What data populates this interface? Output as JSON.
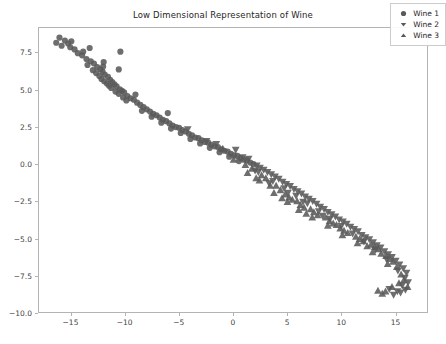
{
  "chart_data": {
    "type": "scatter",
    "title": "Low Dimensional Representation of Wine",
    "xlabel": "",
    "ylabel": "",
    "xlim": [
      -18.0,
      18.0
    ],
    "ylim": [
      -10.0,
      9.2
    ],
    "xticks": [
      -15,
      -10,
      -5,
      0,
      5,
      10,
      15
    ],
    "xticklabels": [
      "−15",
      "−10",
      "−5",
      "0",
      "5",
      "10",
      "15"
    ],
    "yticks": [
      7.5,
      5.0,
      2.5,
      0.0,
      -2.5,
      -5.0,
      -7.5,
      -10.0
    ],
    "yticklabels": [
      "7.5",
      "5.0",
      "2.5",
      "0.0",
      "−2.5",
      "−5.0",
      "−7.5",
      "−10.0"
    ],
    "grid": false,
    "legend_position": "upper right",
    "marker_color": "#5a5a5a",
    "marker_size": 3.1,
    "series": [
      {
        "name": "Wine 1",
        "marker": "circle",
        "color": "#5a5a5a",
        "points": [
          [
            -16.1,
            8.55
          ],
          [
            -15.6,
            8.35
          ],
          [
            -15.3,
            8.15
          ],
          [
            -15.9,
            8.0
          ],
          [
            -15.1,
            7.9
          ],
          [
            -14.7,
            7.75
          ],
          [
            -16.4,
            8.2
          ],
          [
            -15.0,
            8.3
          ],
          [
            -14.4,
            7.5
          ],
          [
            -14.0,
            7.35
          ],
          [
            -13.6,
            7.1
          ],
          [
            -13.9,
            7.6
          ],
          [
            -13.2,
            6.95
          ],
          [
            -13.5,
            6.7
          ],
          [
            -12.9,
            6.8
          ],
          [
            -12.6,
            6.55
          ],
          [
            -13.0,
            6.35
          ],
          [
            -12.3,
            6.4
          ],
          [
            -12.7,
            6.15
          ],
          [
            -12.1,
            6.25
          ],
          [
            -12.4,
            5.95
          ],
          [
            -11.9,
            6.05
          ],
          [
            -12.2,
            5.75
          ],
          [
            -11.6,
            5.9
          ],
          [
            -11.95,
            5.6
          ],
          [
            -11.4,
            5.7
          ],
          [
            -11.7,
            5.45
          ],
          [
            -12.05,
            6.6
          ],
          [
            -11.2,
            5.55
          ],
          [
            -11.5,
            5.3
          ],
          [
            -11.0,
            5.4
          ],
          [
            -11.3,
            5.15
          ],
          [
            -10.8,
            5.25
          ],
          [
            -10.5,
            5.05
          ],
          [
            -10.9,
            4.9
          ],
          [
            -10.3,
            4.95
          ],
          [
            -10.6,
            4.75
          ],
          [
            -10.1,
            4.85
          ],
          [
            -9.8,
            4.6
          ],
          [
            -10.2,
            4.5
          ],
          [
            -9.5,
            4.45
          ],
          [
            -9.9,
            4.3
          ],
          [
            -9.2,
            4.35
          ],
          [
            -8.9,
            4.15
          ],
          [
            -10.45,
            7.6
          ],
          [
            -10.6,
            6.4
          ],
          [
            -8.6,
            4.0
          ],
          [
            -8.3,
            3.85
          ],
          [
            -8.0,
            3.7
          ],
          [
            -8.45,
            3.6
          ],
          [
            -7.7,
            3.55
          ],
          [
            -7.4,
            3.4
          ],
          [
            -7.1,
            3.3
          ],
          [
            -7.55,
            3.2
          ],
          [
            -6.8,
            3.15
          ],
          [
            -6.5,
            3.0
          ],
          [
            -6.2,
            2.9
          ],
          [
            -6.65,
            2.8
          ],
          [
            -5.9,
            2.75
          ],
          [
            -5.6,
            2.6
          ],
          [
            -5.3,
            2.5
          ],
          [
            -5.75,
            2.4
          ],
          [
            -5.0,
            2.45
          ],
          [
            -4.7,
            2.3
          ],
          [
            -4.4,
            2.2
          ],
          [
            -4.85,
            2.1
          ],
          [
            -4.1,
            2.05
          ],
          [
            -3.8,
            1.95
          ],
          [
            -3.5,
            1.8
          ],
          [
            -3.95,
            1.7
          ],
          [
            -3.2,
            1.75
          ],
          [
            -2.9,
            1.6
          ],
          [
            -2.6,
            1.5
          ],
          [
            -3.05,
            1.4
          ],
          [
            -2.3,
            1.45
          ],
          [
            -2.0,
            1.3
          ],
          [
            -1.7,
            1.2
          ],
          [
            -2.15,
            1.1
          ],
          [
            -1.4,
            1.15
          ],
          [
            -1.1,
            1.0
          ],
          [
            -0.8,
            0.9
          ],
          [
            -1.25,
            0.8
          ],
          [
            -0.5,
            0.85
          ],
          [
            -0.2,
            0.7
          ],
          [
            0.1,
            0.6
          ],
          [
            -0.35,
            0.5
          ],
          [
            0.4,
            0.55
          ],
          [
            0.7,
            0.4
          ],
          [
            1.0,
            0.3
          ],
          [
            0.55,
            0.2
          ],
          [
            1.3,
            0.25
          ],
          [
            1.6,
            0.1
          ],
          [
            1.9,
            0.0
          ],
          [
            -13.3,
            7.85
          ],
          [
            -12.0,
            6.9
          ],
          [
            -9.05,
            4.7
          ],
          [
            -6.05,
            3.45
          ]
        ]
      },
      {
        "name": "Wine 2",
        "marker": "triangle-down",
        "color": "#5a5a5a",
        "points": [
          [
            -4.2,
            2.35
          ],
          [
            -2.45,
            1.55
          ],
          [
            -1.55,
            1.35
          ],
          [
            0.25,
            0.95
          ],
          [
            0.9,
            0.45
          ],
          [
            1.45,
            0.35
          ],
          [
            2.2,
            -0.1
          ],
          [
            2.5,
            -0.25
          ],
          [
            2.85,
            -0.4
          ],
          [
            3.2,
            -0.55
          ],
          [
            2.35,
            -0.55
          ],
          [
            3.55,
            -0.7
          ],
          [
            3.9,
            -0.85
          ],
          [
            4.25,
            -1.0
          ],
          [
            3.7,
            -1.15
          ],
          [
            4.6,
            -1.2
          ],
          [
            4.95,
            -1.35
          ],
          [
            5.3,
            -1.5
          ],
          [
            4.75,
            -1.65
          ],
          [
            5.65,
            -1.7
          ],
          [
            6.0,
            -1.85
          ],
          [
            6.35,
            -2.0
          ],
          [
            5.85,
            -2.15
          ],
          [
            6.7,
            -2.2
          ],
          [
            7.05,
            -2.35
          ],
          [
            7.4,
            -2.5
          ],
          [
            6.9,
            -2.65
          ],
          [
            7.75,
            -2.7
          ],
          [
            8.1,
            -2.9
          ],
          [
            8.45,
            -3.05
          ],
          [
            7.95,
            -3.2
          ],
          [
            8.8,
            -3.25
          ],
          [
            9.15,
            -3.4
          ],
          [
            9.5,
            -3.55
          ],
          [
            9.0,
            -3.7
          ],
          [
            9.85,
            -3.75
          ],
          [
            10.2,
            -3.9
          ],
          [
            10.55,
            -4.05
          ],
          [
            10.05,
            -4.2
          ],
          [
            10.9,
            -4.25
          ],
          [
            11.25,
            -4.4
          ],
          [
            11.6,
            -4.55
          ],
          [
            11.1,
            -4.7
          ],
          [
            11.95,
            -4.8
          ],
          [
            12.3,
            -4.95
          ],
          [
            12.65,
            -5.1
          ],
          [
            12.15,
            -5.25
          ],
          [
            13.0,
            -5.3
          ],
          [
            13.35,
            -5.5
          ],
          [
            13.7,
            -5.65
          ],
          [
            13.2,
            -5.8
          ],
          [
            14.05,
            -5.9
          ],
          [
            14.4,
            -6.1
          ],
          [
            14.75,
            -6.3
          ],
          [
            14.25,
            -6.45
          ],
          [
            15.1,
            -6.55
          ],
          [
            15.45,
            -6.8
          ],
          [
            15.8,
            -7.05
          ],
          [
            15.3,
            -7.2
          ],
          [
            16.1,
            -7.35
          ],
          [
            15.95,
            -7.7
          ],
          [
            16.25,
            -8.0
          ],
          [
            15.7,
            -8.2
          ],
          [
            16.0,
            -8.5
          ],
          [
            15.55,
            -8.7
          ],
          [
            14.9,
            -8.85
          ],
          [
            15.25,
            -8.6
          ],
          [
            14.5,
            -8.45
          ],
          [
            2.05,
            -0.45
          ],
          [
            3.35,
            -1.3
          ],
          [
            5.1,
            -1.95
          ],
          [
            6.5,
            -2.55
          ],
          [
            8.3,
            -3.5
          ]
        ]
      },
      {
        "name": "Wine 3",
        "marker": "triangle-up",
        "color": "#5a5a5a",
        "points": [
          [
            -0.95,
            1.05
          ],
          [
            0.05,
            0.3
          ],
          [
            1.15,
            -0.05
          ],
          [
            1.75,
            -0.3
          ],
          [
            2.65,
            -0.75
          ],
          [
            3.05,
            -0.95
          ],
          [
            2.15,
            -0.95
          ],
          [
            3.45,
            -1.45
          ],
          [
            4.0,
            -1.45
          ],
          [
            4.4,
            -1.75
          ],
          [
            3.8,
            -1.95
          ],
          [
            4.85,
            -2.05
          ],
          [
            5.2,
            -2.25
          ],
          [
            5.5,
            -2.4
          ],
          [
            5.05,
            -2.55
          ],
          [
            5.95,
            -2.5
          ],
          [
            6.25,
            -2.75
          ],
          [
            6.6,
            -2.95
          ],
          [
            6.1,
            -3.1
          ],
          [
            7.2,
            -3.05
          ],
          [
            7.5,
            -3.25
          ],
          [
            7.85,
            -3.45
          ],
          [
            7.35,
            -3.6
          ],
          [
            8.6,
            -3.6
          ],
          [
            8.95,
            -3.85
          ],
          [
            9.3,
            -4.0
          ],
          [
            8.8,
            -4.15
          ],
          [
            9.95,
            -4.35
          ],
          [
            10.3,
            -4.5
          ],
          [
            10.65,
            -4.65
          ],
          [
            10.15,
            -4.8
          ],
          [
            11.4,
            -4.9
          ],
          [
            11.75,
            -5.05
          ],
          [
            12.1,
            -5.2
          ],
          [
            11.55,
            -5.35
          ],
          [
            12.8,
            -5.45
          ],
          [
            13.15,
            -5.6
          ],
          [
            13.5,
            -5.75
          ],
          [
            12.95,
            -5.95
          ],
          [
            14.2,
            -6.2
          ],
          [
            14.55,
            -6.4
          ],
          [
            14.85,
            -6.6
          ],
          [
            14.35,
            -6.75
          ],
          [
            15.2,
            -6.95
          ],
          [
            15.6,
            -7.45
          ],
          [
            15.85,
            -7.85
          ],
          [
            15.4,
            -8.05
          ],
          [
            16.2,
            -8.3
          ],
          [
            14.75,
            -8.3
          ],
          [
            14.15,
            -8.6
          ],
          [
            13.85,
            -8.75
          ],
          [
            13.45,
            -8.55
          ],
          [
            1.35,
            -0.6
          ],
          [
            2.45,
            -1.1
          ],
          [
            4.55,
            -2.3
          ],
          [
            6.8,
            -3.35
          ],
          [
            9.6,
            -4.1
          ],
          [
            12.45,
            -5.55
          ],
          [
            13.75,
            -6.05
          ]
        ]
      }
    ]
  },
  "legend": {
    "entries": [
      {
        "label": "Wine 1",
        "marker": "circle-marker-icon"
      },
      {
        "label": "Wine 2",
        "marker": "triangle-down-marker-icon"
      },
      {
        "label": "Wine 3",
        "marker": "triangle-up-marker-icon"
      }
    ]
  }
}
